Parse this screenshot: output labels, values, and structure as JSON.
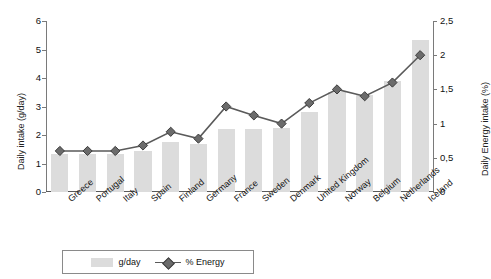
{
  "chart_data": {
    "type": "bar",
    "title": "",
    "xlabel": "",
    "ylabel": "Daily intake (g/day)",
    "y2label": "Daily Energy intake (%)",
    "ylim": [
      0,
      6
    ],
    "y2lim": [
      0,
      2.5
    ],
    "yticks": [
      "0",
      "1",
      "2",
      "3",
      "4",
      "5",
      "6"
    ],
    "ytick_values": [
      0,
      1,
      2,
      3,
      4,
      5,
      6
    ],
    "y2ticks": [
      "0",
      "0,5",
      "1",
      "1,5",
      "2",
      "2,5"
    ],
    "y2tick_values": [
      0,
      0.5,
      1,
      1.5,
      2,
      2.5
    ],
    "grid": false,
    "legend_position": "bottom",
    "categories": [
      "Greece",
      "Portugal",
      "Italy",
      "Spain",
      "Finland",
      "Germany",
      "France",
      "Sweden",
      "Denmark",
      "United Kingdom",
      "Norway",
      "Belgium",
      "Netherlands",
      "Iceland"
    ],
    "series": [
      {
        "name": "g/day",
        "type": "bar",
        "axis": "left",
        "color": "#dcdcdc",
        "values": [
          1.35,
          1.35,
          1.35,
          1.45,
          1.75,
          1.7,
          2.2,
          2.2,
          2.25,
          2.8,
          3.5,
          3.4,
          3.9,
          5.35
        ]
      },
      {
        "name": "% Energy",
        "type": "line",
        "axis": "right",
        "color": "#6b6b6b",
        "marker": "diamond",
        "values": [
          0.6,
          0.6,
          0.6,
          0.68,
          0.88,
          0.78,
          1.25,
          1.12,
          1.0,
          1.3,
          1.5,
          1.4,
          1.6,
          2.0
        ]
      }
    ]
  },
  "legend": {
    "items": [
      {
        "label": "g/day",
        "marker": "bar-swatch"
      },
      {
        "label": "% Energy",
        "marker": "line-diamond"
      }
    ]
  }
}
